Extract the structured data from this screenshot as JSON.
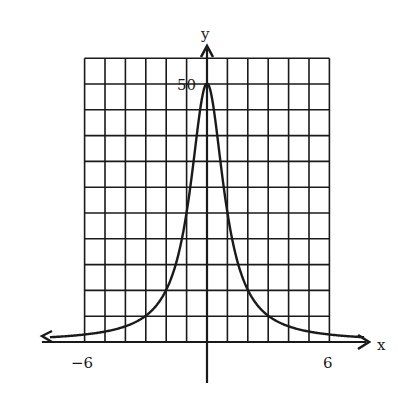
{
  "chart_data": {
    "type": "line",
    "title": "",
    "function": "y = 50 / (1 + x^2)",
    "xlabel": "x",
    "ylabel": "y",
    "xlim": [
      -6,
      6
    ],
    "ylim": [
      0,
      55
    ],
    "grid": true,
    "grid_step_x": 1,
    "grid_step_y": 5,
    "x_tick_labels": [
      {
        "value": -6,
        "label": "−6"
      },
      {
        "value": 6,
        "label": "6"
      }
    ],
    "y_tick_labels": [
      {
        "value": 50,
        "label": "50"
      }
    ],
    "series": [
      {
        "name": "f(x)",
        "x": [
          -8,
          -7,
          -6,
          -5,
          -4,
          -3,
          -2.5,
          -2,
          -1.5,
          -1,
          -0.75,
          -0.5,
          -0.25,
          0,
          0.25,
          0.5,
          0.75,
          1,
          1.5,
          2,
          2.5,
          3,
          4,
          5,
          6,
          7,
          8
        ],
        "values": [
          0.77,
          1.0,
          1.35,
          1.92,
          2.94,
          5.0,
          6.9,
          10.0,
          15.38,
          25.0,
          32.0,
          40.0,
          47.06,
          50.0,
          47.06,
          40.0,
          32.0,
          25.0,
          15.38,
          10.0,
          6.9,
          5.0,
          2.94,
          1.92,
          1.35,
          1.0,
          0.77
        ]
      }
    ],
    "color": "#1a1a1a"
  },
  "labels": {
    "x_axis": "x",
    "y_axis": "y",
    "y_peak": "50",
    "x_min": "−6",
    "x_max": "6"
  }
}
